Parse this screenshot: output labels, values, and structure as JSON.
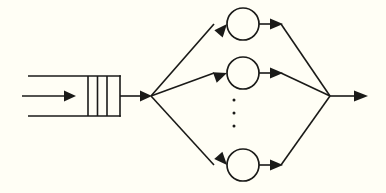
{
  "diagram": {
    "background_color": "#fffef5",
    "line_color": "#1a1a18",
    "canvas": {
      "width": 386,
      "height": 193
    },
    "arrival": {
      "label": "arrival-arrow",
      "from_x": 22,
      "to_x": 76,
      "y": 96
    },
    "queue": {
      "label": "queue-buffer",
      "left_x": 28,
      "right_x": 120,
      "top_y": 76,
      "bottom_y": 116,
      "dividers_x": [
        88,
        97.5,
        107
      ],
      "slot_count": 3,
      "open_side": "left"
    },
    "dispatch": {
      "label": "dispatch-node",
      "x": 151,
      "y": 96,
      "feed_from_x": 120,
      "feed_to_x": 151
    },
    "servers": [
      {
        "id": "server-top",
        "cx": 243,
        "cy": 24,
        "r": 16
      },
      {
        "id": "server-middle",
        "cx": 243,
        "cy": 73,
        "r": 16
      },
      {
        "id": "server-bottom",
        "cx": 243,
        "cy": 165,
        "r": 16
      }
    ],
    "server_count_label": "vertical-ellipsis",
    "ellipsis_dots": [
      {
        "cx": 234,
        "cy": 100,
        "r": 1.5
      },
      {
        "cx": 234,
        "cy": 113,
        "r": 1.5
      },
      {
        "cx": 234,
        "cy": 126,
        "r": 1.5
      }
    ],
    "merge": {
      "label": "merge-node",
      "x": 330,
      "y": 96
    },
    "departure": {
      "label": "departure-arrow",
      "from_x": 330,
      "to_x": 368,
      "y": 96
    },
    "inbound_links": [
      {
        "id": "link-dispatch-to-top",
        "x1": 151,
        "y1": 96,
        "x2": 213,
        "y2": 24
      },
      {
        "id": "link-dispatch-to-middle",
        "x1": 151,
        "y1": 96,
        "x2": 213,
        "y2": 73
      },
      {
        "id": "link-dispatch-to-bottom",
        "x1": 151,
        "y1": 96,
        "x2": 213,
        "y2": 165
      }
    ],
    "outbound_links": [
      {
        "id": "link-top-to-merge",
        "x1": 259,
        "y1": 24,
        "x2": 330,
        "y2": 96
      },
      {
        "id": "link-middle-to-merge",
        "x1": 259,
        "y1": 73,
        "x2": 330,
        "y2": 96
      },
      {
        "id": "link-bottom-to-merge",
        "x1": 259,
        "y1": 165,
        "x2": 330,
        "y2": 96
      }
    ]
  }
}
